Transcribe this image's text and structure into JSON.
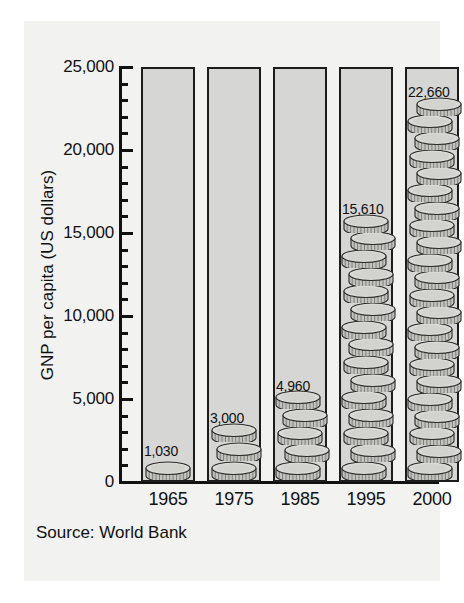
{
  "chart_data": {
    "type": "bar",
    "title": "",
    "subtitle": "",
    "xlabel": "",
    "ylabel": "GNP per capita (US dollars)",
    "categories": [
      "1965",
      "1975",
      "1985",
      "1995",
      "2000"
    ],
    "values": [
      1030,
      3000,
      4960,
      15610,
      22660
    ],
    "value_labels": [
      "1,030",
      "3,000",
      "4,960",
      "15,610",
      "22,660"
    ],
    "ylim": [
      0,
      25000
    ],
    "y_major_ticks": [
      0,
      5000,
      10000,
      15000,
      20000,
      25000
    ],
    "y_major_tick_labels": [
      "0",
      "5,000",
      "10,000",
      "15,000",
      "20,000",
      "25,000"
    ],
    "y_minor_tick_interval": 1000,
    "grid": false,
    "legend": "none",
    "series": [
      {
        "name": "GNP per capita (US dollars)",
        "values": [
          1030,
          3000,
          4960,
          15610,
          22660
        ]
      }
    ],
    "annotations": [
      "Source: World Bank"
    ],
    "bar_style": "outlined column filled with stacked 3D coin pictograms",
    "colors": {
      "bar_fill": "#d6d6d4",
      "bar_outline": "#1c1c1c",
      "coin_face": "#cfcfcc",
      "coin_edge": "#b4b4b0",
      "axis": "#111111",
      "background": "#f2f2f1"
    }
  },
  "source_note": "Source: World Bank",
  "axis": {
    "y_title": "GNP per capita (US dollars)",
    "y_labels": [
      "25,000",
      "20,000",
      "15,000",
      "10,000",
      "5,000",
      "0"
    ],
    "x_labels": [
      "1965",
      "1975",
      "1985",
      "1995",
      "2000"
    ]
  },
  "bars": [
    {
      "category": "1965",
      "value": 1030,
      "label": "1,030"
    },
    {
      "category": "1975",
      "value": 3000,
      "label": "3,000"
    },
    {
      "category": "1985",
      "value": 4960,
      "label": "4,960"
    },
    {
      "category": "1995",
      "value": 15610,
      "label": "15,610"
    },
    {
      "category": "2000",
      "value": 22660,
      "label": "22,660"
    }
  ]
}
